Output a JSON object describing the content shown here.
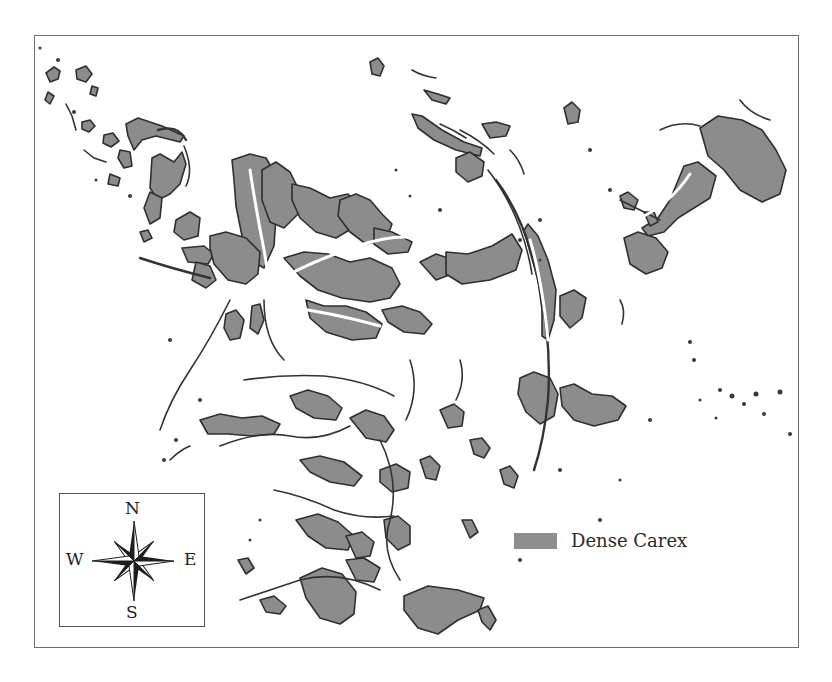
{
  "figure": {
    "type": "vegetation-classification-map",
    "fill_color": "#8c8c8c",
    "outline_color": "#2f2f2f",
    "background_color": "#ffffff"
  },
  "legend": {
    "items": [
      {
        "label": "Dense Carex",
        "swatch_color": "#8e8e8e"
      }
    ]
  },
  "compass": {
    "icon": "compass-rose-icon",
    "north": "N",
    "south": "S",
    "east": "E",
    "west": "W"
  }
}
